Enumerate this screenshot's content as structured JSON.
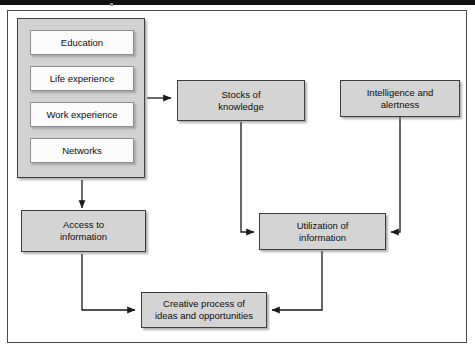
{
  "figure": {
    "type": "flow-diagram",
    "title": "",
    "background_color": "#ffffff",
    "frame_color": "#4a4a4a",
    "node_fill": "#d4d4d4",
    "node_border": "#3d3d3d",
    "white_node_fill": "#fbfbfb",
    "arrow_color": "#1a1a1a"
  },
  "group": {
    "name": "personal-resources-group",
    "items": [
      {
        "id": "education",
        "label": "Education"
      },
      {
        "id": "life-experience",
        "label": "Life experience"
      },
      {
        "id": "work-experience",
        "label": "Work experience"
      },
      {
        "id": "networks",
        "label": "Networks"
      }
    ]
  },
  "nodes": [
    {
      "id": "stocks-of-knowledge",
      "label": "Stocks of\nknowledge"
    },
    {
      "id": "intelligence-and-alertness",
      "label": "Intelligence and\nalertness"
    },
    {
      "id": "access-to-information",
      "label": "Access to\ninformation"
    },
    {
      "id": "utilization-of-information",
      "label": "Utilization of\ninformation"
    },
    {
      "id": "creative-process",
      "label": "Creative process of\nideas and opportunities"
    }
  ],
  "edges": [
    {
      "id": "edge-group-to-stocks",
      "from": "personal-resources-group",
      "to": "stocks-of-knowledge",
      "direction": "right"
    },
    {
      "id": "edge-group-to-access",
      "from": "personal-resources-group",
      "to": "access-to-information",
      "direction": "down"
    },
    {
      "id": "edge-stocks-to-utilization",
      "from": "stocks-of-knowledge",
      "to": "utilization-of-information",
      "direction": "down-right"
    },
    {
      "id": "edge-intelligence-to-utilization",
      "from": "intelligence-and-alertness",
      "to": "utilization-of-information",
      "direction": "down-left"
    },
    {
      "id": "edge-access-to-creative",
      "from": "access-to-information",
      "to": "creative-process",
      "direction": "down-right"
    },
    {
      "id": "edge-utilization-to-creative",
      "from": "utilization-of-information",
      "to": "creative-process",
      "direction": "down-left"
    }
  ]
}
